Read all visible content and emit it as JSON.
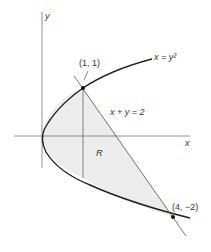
{
  "figure": {
    "axis_x_label": "x",
    "axis_y_label": "y",
    "curve_label": "x = y²",
    "line_label": "x + y = 2",
    "region_label": "R",
    "point_top_label": "(1, 1)",
    "point_bottom_label": "(4, −2)",
    "colors": {
      "region_fill": "#ececec",
      "stroke": "#222222",
      "axis": "#777777"
    }
  }
}
